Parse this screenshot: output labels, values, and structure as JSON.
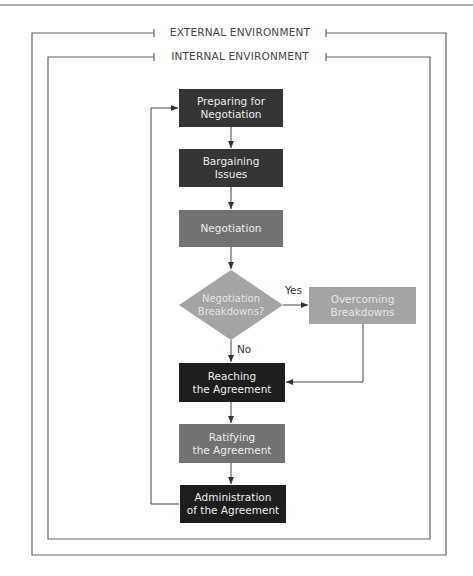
{
  "frames": {
    "external": {
      "label": "EXTERNAL ENVIRONMENT"
    },
    "internal": {
      "label": "INTERNAL ENVIRONMENT"
    }
  },
  "nodes": {
    "preparing": {
      "label": "Preparing for\nNegotiation",
      "shape": "rect",
      "color": "#353535"
    },
    "bargaining": {
      "label": "Bargaining\nIssues",
      "shape": "rect",
      "color": "#353535"
    },
    "negotiation": {
      "label": "Negotiation",
      "shape": "rect",
      "color": "#727272"
    },
    "breakdowns_decision": {
      "label": "Negotiation\nBreakdowns?",
      "shape": "diamond",
      "color": "#a4a4a4"
    },
    "overcoming": {
      "label": "Overcoming\nBreakdowns",
      "shape": "rect",
      "color": "#a4a4a4"
    },
    "reaching": {
      "label": "Reaching\nthe Agreement",
      "shape": "rect",
      "color": "#1e1e1e"
    },
    "ratifying": {
      "label": "Ratifying\nthe Agreement",
      "shape": "rect",
      "color": "#727272"
    },
    "administration": {
      "label": "Administration\nof the Agreement",
      "shape": "rect",
      "color": "#1e1e1e"
    }
  },
  "edges": {
    "yes_label": "Yes",
    "no_label": "No",
    "list": [
      {
        "from": "preparing",
        "to": "bargaining"
      },
      {
        "from": "bargaining",
        "to": "negotiation"
      },
      {
        "from": "negotiation",
        "to": "breakdowns_decision"
      },
      {
        "from": "breakdowns_decision",
        "to": "overcoming",
        "label": "Yes"
      },
      {
        "from": "breakdowns_decision",
        "to": "reaching",
        "label": "No"
      },
      {
        "from": "overcoming",
        "to": "reaching"
      },
      {
        "from": "reaching",
        "to": "ratifying"
      },
      {
        "from": "ratifying",
        "to": "administration"
      },
      {
        "from": "administration",
        "to": "preparing",
        "type": "feedback"
      }
    ]
  }
}
